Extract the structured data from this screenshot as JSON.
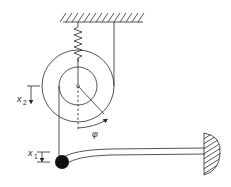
{
  "diagram": {
    "labels": {
      "x2": {
        "base": "x",
        "sub": "2"
      },
      "x1": {
        "base": "x",
        "sub": "1"
      },
      "phi": "φ"
    },
    "components": [
      "ceiling-support",
      "spring",
      "outer-pulley",
      "inner-pulley",
      "rope-right",
      "rope-left",
      "mass",
      "cantilever-beam",
      "wall-support"
    ],
    "colors": {
      "line": "#2a2a2a",
      "mass": "#111111",
      "background": "#ffffff"
    }
  }
}
